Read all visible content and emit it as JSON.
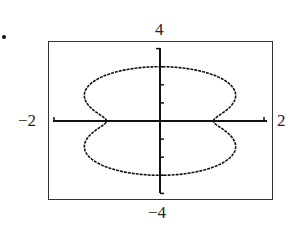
{
  "bullet": "•",
  "labels": {
    "ymax": "4",
    "ymin": "−4",
    "xmin": "−2",
    "xmax": "2"
  },
  "chart_data": {
    "type": "line",
    "title": "",
    "xlabel": "",
    "ylabel": "",
    "xlim": [
      -2,
      2
    ],
    "ylim": [
      -4,
      4
    ],
    "grid": false,
    "legend": null,
    "tick_labels": {
      "x": [
        "−2",
        "2"
      ],
      "y": [
        "−4",
        "4"
      ]
    },
    "y_ticks": [
      -4,
      -3,
      -2,
      -1,
      1,
      2,
      3,
      4
    ],
    "curve": "polar r = 2 − cos(2θ)",
    "key_points": [
      {
        "x": 1,
        "y": 0
      },
      {
        "x": -1,
        "y": 0
      },
      {
        "x": 0,
        "y": 3
      },
      {
        "x": 0,
        "y": -3
      },
      {
        "x": 1.414,
        "y": 1.414
      },
      {
        "x": -1.414,
        "y": 1.414
      },
      {
        "x": 1.414,
        "y": -1.414
      },
      {
        "x": -1.414,
        "y": -1.414
      }
    ],
    "colors": {
      "curve": "#111111",
      "axes": "#111111",
      "frame": "#333333"
    }
  }
}
